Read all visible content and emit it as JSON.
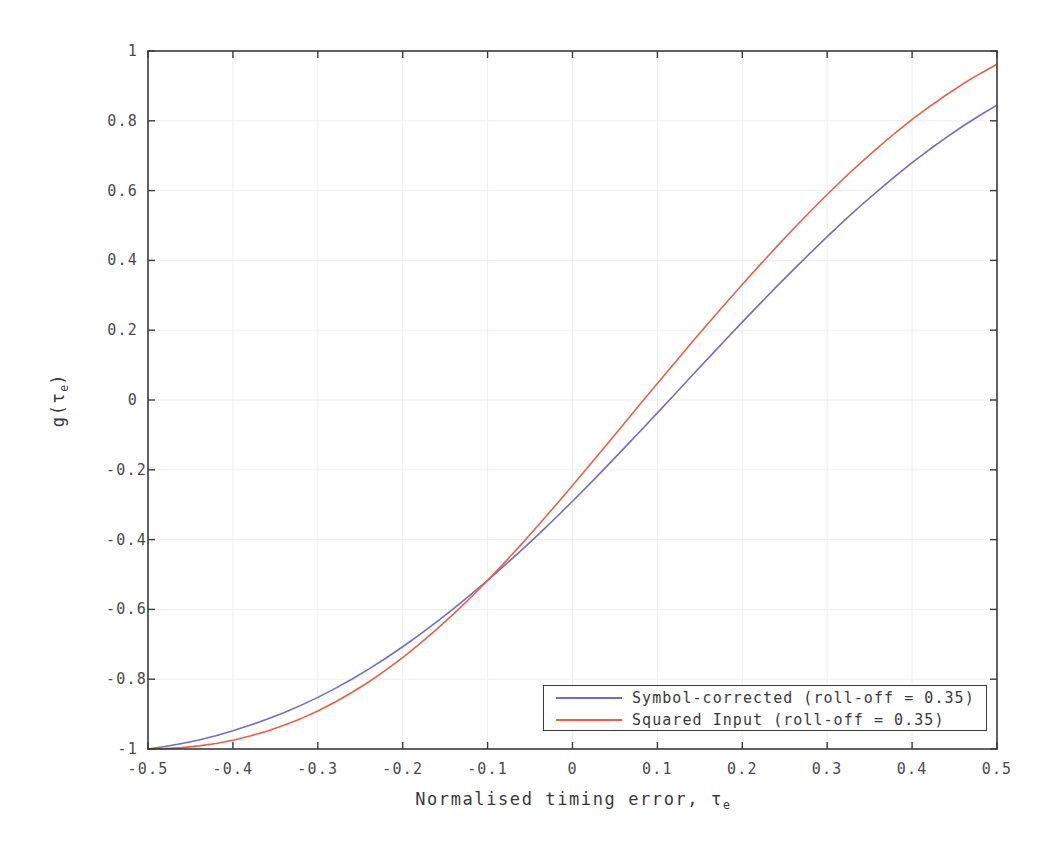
{
  "chart_data": {
    "type": "line",
    "title": "",
    "xlabel": "Normalised timing error,  τe",
    "xlabel_main": "Normalised timing error,  ",
    "xlabel_symbol": "τ",
    "xlabel_symbol_sub": "e",
    "ylabel": "g(τe)",
    "ylabel_pre": "g(",
    "ylabel_symbol": "τ",
    "ylabel_symbol_sub": "e",
    "ylabel_post": ")",
    "xlim": [
      -0.5,
      0.5
    ],
    "ylim": [
      -1,
      1
    ],
    "grid": true,
    "legend_position": "lower right",
    "xticks": [
      -0.5,
      -0.4,
      -0.3,
      -0.2,
      -0.1,
      0,
      0.1,
      0.2,
      0.3,
      0.4,
      0.5
    ],
    "xtick_labels": [
      "-0.5",
      "-0.4",
      "-0.3",
      "-0.2",
      "-0.1",
      "0",
      "0.1",
      "0.2",
      "0.3",
      "0.4",
      "0.5"
    ],
    "yticks": [
      -1,
      -0.8,
      -0.6,
      -0.4,
      -0.2,
      0,
      0.2,
      0.4,
      0.6,
      0.8,
      1
    ],
    "ytick_labels": [
      "-1",
      "-0.8",
      "-0.6",
      "-0.4",
      "-0.2",
      "0",
      "0.2",
      "0.4",
      "0.6",
      "0.8",
      "1"
    ],
    "x": [
      -0.5,
      -0.48,
      -0.46,
      -0.44,
      -0.42,
      -0.4,
      -0.38,
      -0.36,
      -0.34,
      -0.32,
      -0.3,
      -0.28,
      -0.26,
      -0.24,
      -0.22,
      -0.2,
      -0.18,
      -0.16,
      -0.14,
      -0.12,
      -0.1,
      -0.08,
      -0.06,
      -0.04,
      -0.02,
      0,
      0.02,
      0.04,
      0.06,
      0.08,
      0.1,
      0.12,
      0.14,
      0.16,
      0.18,
      0.2,
      0.22,
      0.24,
      0.26,
      0.28,
      0.3,
      0.32,
      0.34,
      0.36,
      0.38,
      0.4,
      0.42,
      0.44,
      0.46,
      0.48,
      0.5
    ],
    "series": [
      {
        "name": "Symbol-corrected (roll-off = 0.35)",
        "label": "Symbol-corrected (roll-off = 0.35)",
        "color": "#6f6fc4",
        "roll_off": 0.35,
        "values": [
          -1.0,
          -0.993,
          -0.984,
          -0.974,
          -0.962,
          -0.948,
          -0.932,
          -0.915,
          -0.896,
          -0.875,
          -0.852,
          -0.827,
          -0.8,
          -0.771,
          -0.74,
          -0.707,
          -0.672,
          -0.636,
          -0.598,
          -0.558,
          -0.517,
          -0.474,
          -0.43,
          -0.385,
          -0.338,
          -0.29,
          -0.241,
          -0.191,
          -0.14,
          -0.089,
          -0.037,
          0.015,
          0.068,
          0.12,
          0.172,
          0.223,
          0.274,
          0.324,
          0.373,
          0.421,
          0.468,
          0.514,
          0.558,
          0.6,
          0.641,
          0.68,
          0.717,
          0.752,
          0.785,
          0.816,
          0.845
        ]
      },
      {
        "name": "Squared Input (roll-off = 0.35)",
        "label": "Squared Input (roll-off = 0.35)",
        "color": "#e8604c",
        "roll_off": 0.35,
        "values": [
          -1.0,
          -0.999,
          -0.996,
          -0.991,
          -0.984,
          -0.975,
          -0.963,
          -0.949,
          -0.932,
          -0.913,
          -0.891,
          -0.866,
          -0.838,
          -0.808,
          -0.774,
          -0.738,
          -0.699,
          -0.657,
          -0.613,
          -0.566,
          -0.517,
          -0.466,
          -0.413,
          -0.358,
          -0.302,
          -0.245,
          -0.187,
          -0.129,
          -0.07,
          -0.011,
          0.047,
          0.105,
          0.163,
          0.22,
          0.276,
          0.331,
          0.385,
          0.438,
          0.49,
          0.54,
          0.589,
          0.636,
          0.681,
          0.724,
          0.765,
          0.804,
          0.84,
          0.874,
          0.906,
          0.935,
          0.962
        ]
      }
    ]
  },
  "legend": {
    "entries": [
      {
        "label": "Symbol-corrected (roll-off = 0.35)",
        "color": "#6f6fc4"
      },
      {
        "label": "Squared Input (roll-off = 0.35)",
        "color": "#e8604c"
      }
    ]
  },
  "style": {
    "background": "#ffffff",
    "axis_color": "#3c3c3c",
    "grid_color": "#eeeeee",
    "text_color": "#3a3a3a"
  }
}
